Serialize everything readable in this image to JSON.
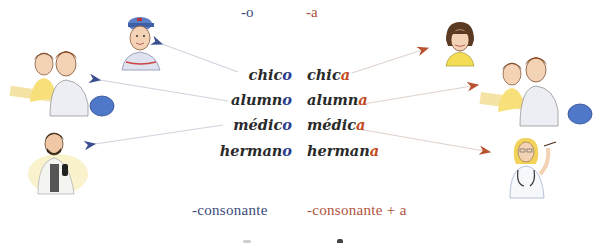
{
  "colors": {
    "masculine": "#3b4a7a",
    "masculine_ending": "#2c3e8c",
    "feminine": "#b0523a",
    "feminine_ending": "#c24a1c",
    "word_text": "#2a2a2a",
    "arrow_left": "#3a4f8f",
    "arrow_right": "#b8532e"
  },
  "header": {
    "masculine_suffix": "-o",
    "feminine_suffix": "-a"
  },
  "masculine_words": [
    {
      "stem": "chic",
      "ending": "o"
    },
    {
      "stem": "alumn",
      "ending": "o"
    },
    {
      "stem": "médic",
      "ending": "o"
    },
    {
      "stem": "herman",
      "ending": "o"
    }
  ],
  "feminine_words": [
    {
      "stem": "chic",
      "ending": "a"
    },
    {
      "stem": "alumn",
      "ending": "a"
    },
    {
      "stem": "médic",
      "ending": "a"
    },
    {
      "stem": "herman",
      "ending": "a"
    }
  ],
  "rules": {
    "masculine": "-consonante",
    "feminine": "-consonante + a"
  },
  "illustrations": {
    "left": [
      "boy-with-cap",
      "two-students-at-desk",
      "male-doctor"
    ],
    "right": [
      "girl",
      "two-students-at-desk",
      "female-doctor"
    ]
  }
}
